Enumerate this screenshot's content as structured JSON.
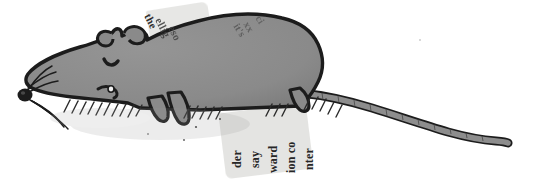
{
  "image": {
    "title": "Rat illustration with newspaper collage",
    "width": 547,
    "height": 181,
    "background_color": "#ffffff",
    "subject": "rat",
    "style": "ink-drawing-with-paper-collage"
  },
  "palette": {
    "background": "#ffffff",
    "body_fill": "#8a8a8a",
    "body_fill_shadow": "#7c7c7c",
    "outline": "#1c1c1c",
    "tail_fill": "#8d8d8d",
    "paper_scrap": "#d9d9d6",
    "scrap_text": "#2c2c2c",
    "hatching": "#2a2a2a"
  },
  "subject": {
    "name": "rat",
    "parts": [
      "head",
      "snout",
      "nose",
      "closed-eye",
      "left-ear",
      "right-ear",
      "whiskers",
      "body",
      "front-leg",
      "hind-leg",
      "tail",
      "ground-hatching"
    ]
  },
  "collage": {
    "scraps": [
      {
        "id": "top-scrap",
        "position": "upper-left-back",
        "rotation_deg": -9,
        "lines": [
          "the",
          "ellig",
          "eso"
        ]
      },
      {
        "id": "mid-scrap",
        "position": "upper-mid-back",
        "rotation_deg": -9,
        "lines": [
          "it's",
          "xx",
          "ci"
        ]
      },
      {
        "id": "bottom-scrap",
        "position": "below-belly",
        "rotation_deg": -7,
        "lines": [
          "der",
          "say",
          "ward",
          "ion co",
          "nter"
        ]
      }
    ]
  },
  "text_fragments": {
    "top_1": "the",
    "top_2": "ellig",
    "top_3": "eso",
    "mid_1": "it's",
    "mid_2": "xx",
    "mid_3": "ci",
    "bottom_1": "der",
    "bottom_2": "say",
    "bottom_3": "ward",
    "bottom_4": "ion co",
    "bottom_5": "nter"
  }
}
